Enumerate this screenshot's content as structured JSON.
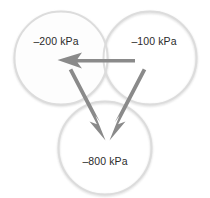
{
  "figure": {
    "type": "diagram",
    "subtype": "water-potential-flow-diagram",
    "canvas": {
      "width": 210,
      "height": 198
    },
    "background_color": "#ffffff",
    "circle_stroke_color": "#dcdcdc",
    "circle_fill_color": "#fdfdfd",
    "arrow_color": "#8a8a8a",
    "label_color": "#2b2b2b",
    "nodes": [
      {
        "id": "left",
        "name": "left-cell",
        "label": "–200 kPa",
        "value": -200,
        "unit": "kPa",
        "cx": 61,
        "cy": 58,
        "r": 47,
        "label_x": 56,
        "label_y": 42
      },
      {
        "id": "right",
        "name": "right-cell",
        "label": "–100 kPa",
        "value": -100,
        "unit": "kPa",
        "cx": 150,
        "cy": 58,
        "r": 47,
        "label_x": 154,
        "label_y": 42
      },
      {
        "id": "bottom",
        "name": "bottom-cell",
        "label": "–800 kPa",
        "value": -800,
        "unit": "kPa",
        "cx": 105,
        "cy": 148,
        "r": 47,
        "label_x": 105,
        "label_y": 162
      }
    ],
    "arrows": [
      {
        "id": "right-to-left",
        "name": "arrow-right-to-left",
        "from": "right",
        "to": "left",
        "direction": "horizontal-left"
      },
      {
        "id": "left-to-bottom",
        "name": "arrow-left-to-bottom",
        "from": "left",
        "to": "bottom",
        "direction": "diagonal-down-right"
      },
      {
        "id": "right-to-bottom",
        "name": "arrow-right-to-bottom",
        "from": "right",
        "to": "bottom",
        "direction": "diagonal-down-left"
      }
    ]
  }
}
